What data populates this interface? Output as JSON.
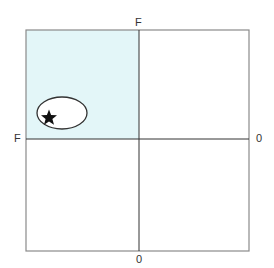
{
  "diagram": {
    "title_clipped": true,
    "labels": {
      "top": "F",
      "left": "F",
      "right": "0",
      "bottom": "0"
    },
    "quadrants": {
      "top_left_fill": "#e3f6f8",
      "other_fill": "#ffffff"
    },
    "border_color": "#777777",
    "axis_color": "#333333",
    "marker": {
      "shape": "star",
      "color": "#111111",
      "enclosed_by": "ellipse"
    }
  }
}
